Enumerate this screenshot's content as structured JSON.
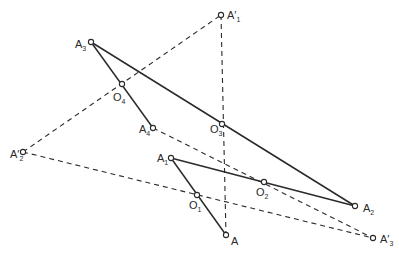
{
  "diagram": {
    "points": [
      {
        "id": "A1p",
        "label": "A",
        "prime": true,
        "sub": "1",
        "x": 221,
        "y": 15,
        "lx": 227,
        "ly": 19
      },
      {
        "id": "A3",
        "label": "A",
        "prime": false,
        "sub": "3",
        "x": 91,
        "y": 42,
        "lx": 75,
        "ly": 48
      },
      {
        "id": "O4",
        "label": "O",
        "prime": false,
        "sub": "4",
        "x": 122,
        "y": 84,
        "lx": 113,
        "ly": 101
      },
      {
        "id": "A4",
        "label": "A",
        "prime": false,
        "sub": "4",
        "x": 153,
        "y": 128,
        "lx": 139,
        "ly": 133
      },
      {
        "id": "O3",
        "label": "O",
        "prime": false,
        "sub": "3",
        "x": 222,
        "y": 124,
        "lx": 210,
        "ly": 133
      },
      {
        "id": "A2p",
        "label": "A",
        "prime": true,
        "sub": "2",
        "x": 23,
        "y": 152,
        "lx": 10,
        "ly": 158
      },
      {
        "id": "A1",
        "label": "A",
        "prime": false,
        "sub": "1",
        "x": 171,
        "y": 158,
        "lx": 157,
        "ly": 162
      },
      {
        "id": "O2",
        "label": "O",
        "prime": false,
        "sub": "2",
        "x": 264,
        "y": 182,
        "lx": 256,
        "ly": 196
      },
      {
        "id": "O1",
        "label": "O",
        "prime": false,
        "sub": "1",
        "x": 197,
        "y": 195,
        "lx": 189,
        "ly": 209
      },
      {
        "id": "A2",
        "label": "A",
        "prime": false,
        "sub": "2",
        "x": 355,
        "y": 206,
        "lx": 363,
        "ly": 212
      },
      {
        "id": "A",
        "label": "A",
        "prime": false,
        "sub": "",
        "x": 226,
        "y": 235,
        "lx": 231,
        "ly": 245
      },
      {
        "id": "A3p",
        "label": "A",
        "prime": true,
        "sub": "3",
        "x": 373,
        "y": 238,
        "lx": 380,
        "ly": 243
      }
    ],
    "solid_lines": [
      {
        "from": "A3",
        "to": "A2"
      },
      {
        "from": "A3",
        "to": "A4"
      },
      {
        "from": "A1",
        "to": "A2"
      },
      {
        "from": "A1",
        "to": "A"
      }
    ],
    "dashed_lines": [
      {
        "from": "A2p",
        "to": "A1p"
      },
      {
        "from": "A1p",
        "to": "A"
      },
      {
        "from": "A2p",
        "to": "A3p"
      },
      {
        "from": "A4",
        "to": "A3p"
      }
    ]
  }
}
